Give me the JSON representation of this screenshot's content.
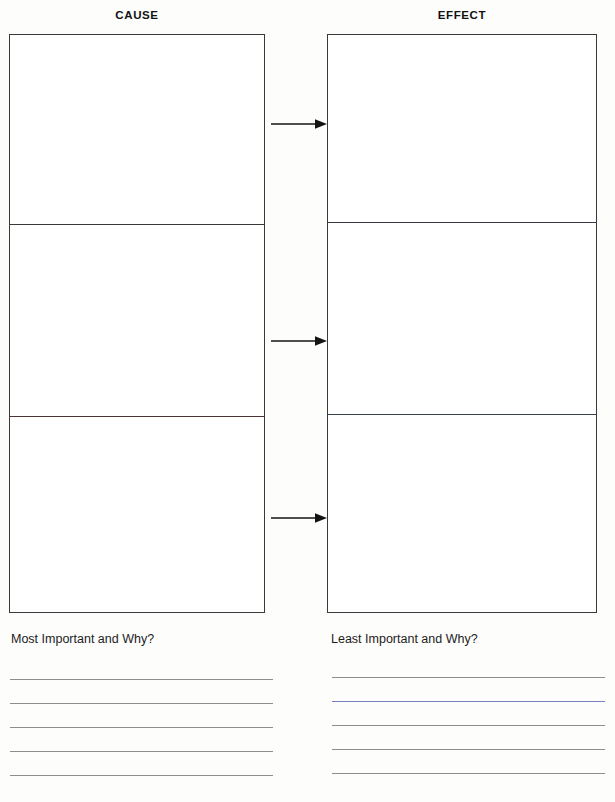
{
  "worksheet": {
    "title": "Cause and Effect Graphic Organizer",
    "background_color": "#fdfdfc",
    "ink_color": "#3a3a3a"
  },
  "headings": {
    "cause": "CAUSE",
    "effect": "EFFECT"
  },
  "columns": [
    {
      "id": "cause",
      "heading": "CAUSE",
      "cells": [
        {
          "id": "cause-1",
          "content": ""
        },
        {
          "id": "cause-2",
          "content": ""
        },
        {
          "id": "cause-3",
          "content": ""
        }
      ]
    },
    {
      "id": "effect",
      "heading": "EFFECT",
      "cells": [
        {
          "id": "effect-1",
          "content": ""
        },
        {
          "id": "effect-2",
          "content": ""
        },
        {
          "id": "effect-3",
          "content": ""
        }
      ]
    }
  ],
  "arrows": [
    {
      "id": "arrow-1",
      "direction": "right",
      "from": "cause-1",
      "to": "effect-1",
      "top": 117
    },
    {
      "id": "arrow-2",
      "direction": "right",
      "from": "cause-2",
      "to": "effect-2",
      "top": 334
    },
    {
      "id": "arrow-3",
      "direction": "right",
      "from": "cause-3",
      "to": "effect-3",
      "top": 511
    }
  ],
  "prompts": {
    "left": "Most Important and Why?",
    "right": "Least Important and Why?"
  },
  "answer_lines": {
    "left": [
      {
        "id": "left-line-1",
        "top": 679,
        "value": ""
      },
      {
        "id": "left-line-2",
        "top": 703,
        "value": ""
      },
      {
        "id": "left-line-3",
        "top": 727,
        "value": ""
      },
      {
        "id": "left-line-4",
        "top": 751,
        "value": ""
      },
      {
        "id": "left-line-5",
        "top": 775,
        "value": ""
      }
    ],
    "right": [
      {
        "id": "right-line-1",
        "top": 677,
        "value": ""
      },
      {
        "id": "right-line-2",
        "top": 701,
        "value": "",
        "tint": "blue"
      },
      {
        "id": "right-line-3",
        "top": 725,
        "value": ""
      },
      {
        "id": "right-line-4",
        "top": 749,
        "value": ""
      },
      {
        "id": "right-line-5",
        "top": 773,
        "value": ""
      }
    ]
  }
}
